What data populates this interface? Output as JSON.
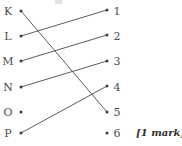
{
  "diagram": {
    "type": "matching-question",
    "left_column": {
      "name": "letters",
      "items": [
        {
          "label": "K",
          "x": 8,
          "y": 11,
          "dot_x": 21,
          "dot_y": 11
        },
        {
          "label": "L",
          "x": 8,
          "y": 36,
          "dot_x": 21,
          "dot_y": 36
        },
        {
          "label": "M",
          "x": 8,
          "y": 61,
          "dot_x": 21,
          "dot_y": 61
        },
        {
          "label": "N",
          "x": 8,
          "y": 87,
          "dot_x": 21,
          "dot_y": 87
        },
        {
          "label": "O",
          "x": 8,
          "y": 112,
          "dot_x": 21,
          "dot_y": 112
        },
        {
          "label": "P",
          "x": 8,
          "y": 133,
          "dot_x": 21,
          "dot_y": 133
        }
      ]
    },
    "right_column": {
      "name": "numbers",
      "items": [
        {
          "label": "1",
          "x": 117,
          "y": 11,
          "dot_x": 107,
          "dot_y": 10
        },
        {
          "label": "2",
          "x": 117,
          "y": 36,
          "dot_x": 107,
          "dot_y": 35
        },
        {
          "label": "3",
          "x": 117,
          "y": 61,
          "dot_x": 107,
          "dot_y": 61
        },
        {
          "label": "4",
          "x": 117,
          "y": 87,
          "dot_x": 107,
          "dot_y": 86
        },
        {
          "label": "5",
          "x": 117,
          "y": 112,
          "dot_x": 107,
          "dot_y": 112
        },
        {
          "label": "6",
          "x": 117,
          "y": 133,
          "dot_x": 107,
          "dot_y": 133
        }
      ]
    },
    "connections": [
      {
        "from": "K",
        "to": "5",
        "x1": 21,
        "y1": 11,
        "x2": 107,
        "y2": 112
      },
      {
        "from": "L",
        "to": "1",
        "x1": 21,
        "y1": 36,
        "x2": 107,
        "y2": 10
      },
      {
        "from": "M",
        "to": "2",
        "x1": 21,
        "y1": 61,
        "x2": 107,
        "y2": 35
      },
      {
        "from": "N",
        "to": "3",
        "x1": 21,
        "y1": 87,
        "x2": 107,
        "y2": 61
      },
      {
        "from": "P",
        "to": "4",
        "x1": 21,
        "y1": 133,
        "x2": 107,
        "y2": 86
      }
    ],
    "unconnected": [
      "O",
      "6"
    ],
    "line_color": "#4a4a4a",
    "dot_color": "#3a3a3a",
    "text_color": "#4a4a4a"
  },
  "annotation": {
    "mark_note": "[1 mark]",
    "mark_note_x": 136,
    "mark_note_y": 127
  }
}
